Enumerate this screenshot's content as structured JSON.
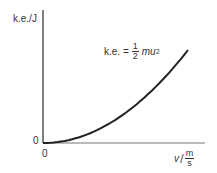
{
  "chart_data": {
    "type": "line",
    "title": "",
    "ylabel": "k.e./J",
    "xlabel_var": "v",
    "xlabel_unit_num": "m",
    "xlabel_unit_den": "s",
    "x_origin_label": "0",
    "y_origin_label": "0",
    "annotation": {
      "prefix": "k.e. =",
      "frac_num": "1",
      "frac_den": "2",
      "expr": "mu",
      "exp": "2"
    },
    "series": [
      {
        "name": "k.e. = 1/2 mu^2",
        "x": [
          0,
          0.1,
          0.2,
          0.3,
          0.4,
          0.5,
          0.6,
          0.7,
          0.8,
          0.9,
          1.0
        ],
        "values": [
          0,
          0.01,
          0.04,
          0.09,
          0.16,
          0.25,
          0.36,
          0.49,
          0.64,
          0.81,
          1.0
        ]
      }
    ],
    "grid": false,
    "axis_ticks": false,
    "colors": {
      "axis": "#555555",
      "curve": "#222222"
    }
  }
}
